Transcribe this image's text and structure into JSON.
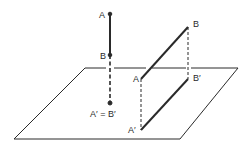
{
  "diagram": {
    "colors": {
      "ink": "#2a2a2a",
      "background": "#ffffff"
    },
    "plane": {
      "points": [
        [
          85,
          68
        ],
        [
          238,
          68
        ],
        [
          180,
          139
        ],
        [
          14,
          139
        ]
      ]
    },
    "left_figure": {
      "labels": {
        "A": "A",
        "B": "B",
        "projection": "A′ = B′"
      },
      "description": "Segment AB perpendicular to plane projects to a single point"
    },
    "right_figure": {
      "labels": {
        "A": "A",
        "B": "B",
        "A_prime": "A′",
        "B_prime": "B′"
      },
      "description": "Segment AB parallel to plane projects to A′B′ of equal length"
    }
  }
}
